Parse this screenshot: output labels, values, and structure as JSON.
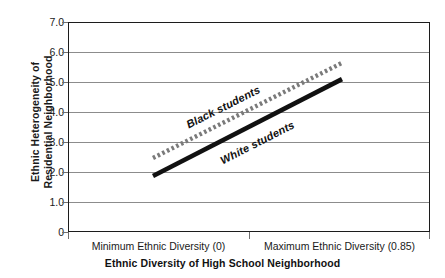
{
  "chart_data": {
    "type": "line",
    "title": "",
    "xlabel": "Ethnic Diversity of High School Neighborhood",
    "ylabel": "Ethnic Heterogeneity of Residential Neighborhood",
    "ylabel_line1": "Ethnic Heterogeneity of",
    "ylabel_line2": "Residential Neighborhood",
    "ylim": [
      0,
      7.0
    ],
    "xlim": [
      0,
      0.85
    ],
    "grid": true,
    "legend_position": "inline-labels",
    "y_ticks": [
      "7.0",
      "6.0",
      "5.0",
      "4.0",
      "3.0",
      "2.0",
      "1.0",
      "0"
    ],
    "y_tick_values": [
      7.0,
      6.0,
      5.0,
      4.0,
      3.0,
      2.0,
      1.0,
      0
    ],
    "x_tick_labels": [
      "Minimum Ethnic Diversity (0)",
      "Maximum Ethnic Diversity (0.85)"
    ],
    "x": [
      0.0,
      0.85
    ],
    "series": [
      {
        "name": "Black students",
        "values": [
          2.5,
          5.67
        ],
        "style": "dotted",
        "color": "#7a7a7a"
      },
      {
        "name": "White students",
        "values": [
          1.9,
          5.13
        ],
        "style": "solid",
        "color": "#111111"
      }
    ],
    "annotations": [
      "Black students",
      "White students"
    ]
  },
  "axes": {
    "y_title_line1": "Ethnic Heterogeneity of",
    "y_title_line2": "Residential Neighborhood",
    "x_title": "Ethnic Diversity of High School Neighborhood",
    "y_tick_0": "7.0",
    "y_tick_1": "6.0",
    "y_tick_2": "5.0",
    "y_tick_3": "4.0",
    "y_tick_4": "3.0",
    "y_tick_5": "2.0",
    "y_tick_6": "1.0",
    "y_tick_7": "0",
    "x_label_min": "Minimum Ethnic Diversity (0)",
    "x_label_max": "Maximum Ethnic Diversity (0.85)"
  },
  "series_labels": {
    "black": "Black students",
    "white": "White students"
  },
  "colors": {
    "axis": "#1c1c1c",
    "gridline": "#8c8c8c",
    "black_series": "#7a7a7a",
    "white_series": "#111111",
    "background": "#ffffff",
    "text": "#1a1a1a"
  }
}
